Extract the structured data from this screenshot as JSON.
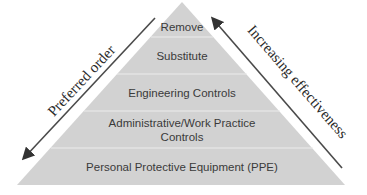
{
  "tiers": [
    {
      "label": "Remove"
    },
    {
      "label": "Substitute"
    },
    {
      "label": "Engineering Controls"
    },
    {
      "label": "Administrative/Work Practice",
      "label2": "Controls"
    },
    {
      "label": "Personal Protective Equipment (PPE)"
    }
  ],
  "left_arrow": {
    "label": "Preferred order",
    "direction": "down"
  },
  "right_arrow": {
    "label": "Increasing effectiveness",
    "direction": "up"
  },
  "colors": {
    "pyramid_fill": "#d2d2d2",
    "tier_divider": "#ececec",
    "arrow": "#4a4a4a",
    "text": "#3a3a3a"
  }
}
